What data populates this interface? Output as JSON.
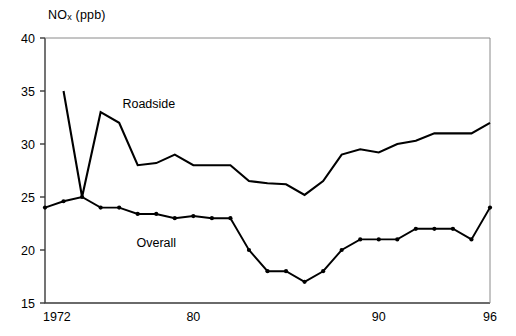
{
  "chart_data": {
    "type": "line",
    "title": "NOx (ppb)",
    "title_main": "NO",
    "title_sub": "x",
    "title_unit": " (ppb)",
    "xlabel": "",
    "ylabel": "NOx (ppb)",
    "xlim": [
      1972,
      1996
    ],
    "ylim": [
      15,
      40
    ],
    "yticks": [
      15,
      20,
      25,
      30,
      35,
      40
    ],
    "ytick_labels": [
      "15",
      "20",
      "25",
      "30",
      "35",
      "40"
    ],
    "xticks": [
      1972,
      1980,
      1990,
      1996
    ],
    "xtick_labels": [
      "1972",
      "80",
      "90",
      "96"
    ],
    "grid": false,
    "legend_position": "inline-annotation",
    "annotations": [
      {
        "text": "Roadside",
        "x": 1977.6,
        "y": 33.4
      },
      {
        "text": "Overall",
        "x": 1978.0,
        "y": 20.3
      }
    ],
    "series": [
      {
        "name": "Roadside",
        "markers": false,
        "x": [
          1973,
          1974,
          1975,
          1976,
          1977,
          1978,
          1979,
          1980,
          1981,
          1982,
          1983,
          1984,
          1985,
          1986,
          1987,
          1988,
          1989,
          1990,
          1991,
          1992,
          1993,
          1994,
          1995,
          1996
        ],
        "values": [
          35,
          25,
          33,
          32,
          28,
          28.2,
          29,
          28,
          28,
          28,
          26.5,
          26.3,
          26.2,
          25.2,
          26.5,
          29,
          29.5,
          29.2,
          30,
          30.3,
          31,
          31,
          31,
          32
        ]
      },
      {
        "name": "Overall",
        "markers": true,
        "x": [
          1972,
          1973,
          1974,
          1975,
          1976,
          1977,
          1978,
          1979,
          1980,
          1981,
          1982,
          1983,
          1984,
          1985,
          1986,
          1987,
          1988,
          1989,
          1990,
          1991,
          1992,
          1993,
          1994,
          1995,
          1996
        ],
        "values": [
          24,
          24.6,
          25,
          24,
          24,
          23.4,
          23.4,
          23,
          23.2,
          23,
          23,
          20,
          18,
          18,
          17,
          18,
          20,
          21,
          21,
          21,
          22,
          22,
          22,
          21,
          24
        ]
      }
    ]
  },
  "colors": {
    "line": "#000000",
    "axis": "#555555",
    "background": "#ffffff"
  }
}
